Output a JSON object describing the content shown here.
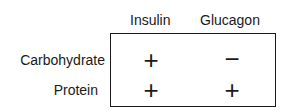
{
  "columns": [
    {
      "label": "Insulin"
    },
    {
      "label": "Glucagon"
    }
  ],
  "rows": [
    {
      "label": "Carbohydrate",
      "values": [
        "+",
        "−"
      ]
    },
    {
      "label": "Protein",
      "values": [
        "+",
        "+"
      ]
    }
  ]
}
